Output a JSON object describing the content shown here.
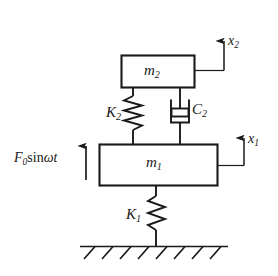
{
  "diagram": {
    "stroke_color": "#1a1a1a",
    "background_color": "#ffffff",
    "labels": {
      "upper_mass": {
        "symbol": "m",
        "subscript": "2",
        "text": "m2"
      },
      "lower_mass": {
        "symbol": "m",
        "subscript": "1",
        "text": "m1"
      },
      "upper_spring": {
        "symbol": "K",
        "subscript": "2",
        "text": "K2"
      },
      "lower_spring": {
        "symbol": "K",
        "subscript": "1",
        "text": "K1"
      },
      "damper": {
        "symbol": "C",
        "subscript": "2",
        "text": "C2"
      },
      "upper_displacement": {
        "symbol": "x",
        "subscript": "2",
        "text": "x2"
      },
      "lower_displacement": {
        "symbol": "x",
        "subscript": "1",
        "text": "x1"
      },
      "force": {
        "symbol": "F",
        "subscript": "0",
        "function": "sin",
        "argument": "ωt",
        "text": "F0 sinωt"
      }
    },
    "elements": [
      {
        "name": "mass-block-m2",
        "kind": "rectangle",
        "label": "m2"
      },
      {
        "name": "mass-block-m1",
        "kind": "rectangle",
        "label": "m1"
      },
      {
        "name": "spring-k2",
        "kind": "zigzag-spring",
        "label": "K2",
        "coils": 4
      },
      {
        "name": "spring-k1",
        "kind": "zigzag-spring",
        "label": "K1",
        "coils": 3
      },
      {
        "name": "damper-c2",
        "kind": "dashpot",
        "label": "C2"
      },
      {
        "name": "ground-hatching",
        "kind": "hatched-line",
        "hatch_count": 8
      },
      {
        "name": "displacement-arrow-x2",
        "kind": "up-arrow",
        "label": "x2"
      },
      {
        "name": "displacement-arrow-x1",
        "kind": "up-arrow",
        "label": "x1"
      },
      {
        "name": "force-arrow",
        "kind": "up-arrow",
        "label": "F0 sinωt"
      }
    ]
  }
}
